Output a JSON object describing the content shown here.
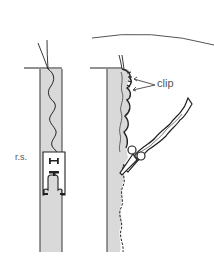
{
  "illustration": {
    "description": "Sewing diagram: stitching a strip right side up with a presser foot, then clipping the seam allowance",
    "labels": {
      "right_side": "r.s.",
      "clip": "clip"
    },
    "colors": {
      "fabric_fill": "#d9d9d9",
      "outline": "#222222",
      "label_text": "#555555",
      "background": "#ffffff"
    }
  }
}
